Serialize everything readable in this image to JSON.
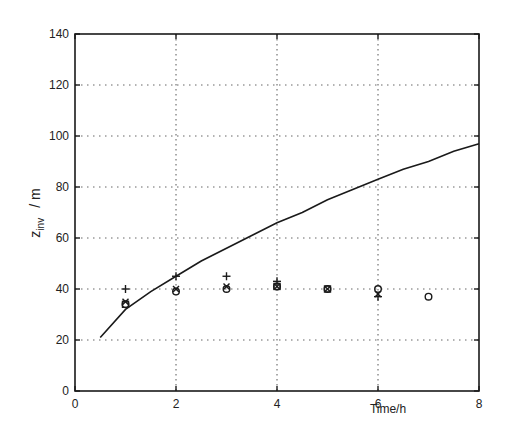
{
  "chart_data": {
    "type": "line",
    "title": "",
    "xlabel": "Time/h",
    "ylabel": "z_inv / m",
    "ylabel_main": "z",
    "ylabel_sub": "inv",
    "ylabel_unit": "/ m",
    "xlim": [
      0,
      8
    ],
    "ylim": [
      0,
      140
    ],
    "xticks": [
      0,
      2,
      4,
      6,
      8
    ],
    "yticks": [
      0,
      20,
      40,
      60,
      80,
      100,
      120,
      140
    ],
    "grid": true,
    "legend": null,
    "series": [
      {
        "name": "model curve",
        "style": "line",
        "x": [
          0.5,
          1,
          1.5,
          2,
          2.5,
          3,
          3.5,
          4,
          4.5,
          5,
          5.5,
          6,
          6.5,
          7,
          7.5,
          8
        ],
        "values": [
          21,
          32,
          39,
          45,
          51,
          56,
          61,
          66,
          70,
          75,
          79,
          83,
          87,
          90,
          94,
          97
        ]
      },
      {
        "name": "plus markers",
        "style": "marker",
        "marker": "+",
        "x": [
          1,
          2,
          3,
          4,
          6
        ],
        "values": [
          40,
          45,
          45,
          43,
          37
        ]
      },
      {
        "name": "cross markers",
        "style": "marker",
        "marker": "x",
        "x": [
          1,
          2,
          3,
          4,
          5,
          6
        ],
        "values": [
          35,
          40,
          41,
          41,
          40,
          38
        ]
      },
      {
        "name": "circle markers",
        "style": "marker",
        "marker": "o",
        "x": [
          1,
          2,
          3,
          4,
          5,
          6,
          7
        ],
        "values": [
          34,
          39,
          40,
          41,
          40,
          40,
          37
        ]
      },
      {
        "name": "square markers",
        "style": "marker",
        "marker": "square",
        "x": [
          1,
          4,
          5
        ],
        "values": [
          34,
          41,
          40
        ]
      }
    ]
  },
  "plot": {
    "left": 75,
    "right": 479,
    "top": 34,
    "bottom": 391
  }
}
